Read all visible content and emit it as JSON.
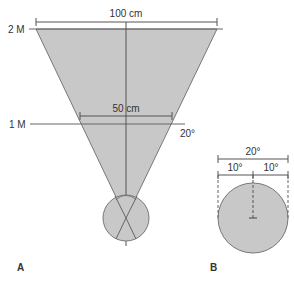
{
  "panel_a": {
    "label": "A",
    "distance_far_label": "2 M",
    "distance_near_label": "1 M",
    "width_far_label": "100 cm",
    "width_near_label": "50 cm",
    "angle_label": "20°"
  },
  "panel_b": {
    "label": "B",
    "total_angle_label": "20°",
    "left_half_label": "10°",
    "right_half_label": "10°"
  },
  "colors": {
    "fill": "#c8c8c8",
    "stroke": "#666666",
    "text": "#333333"
  }
}
